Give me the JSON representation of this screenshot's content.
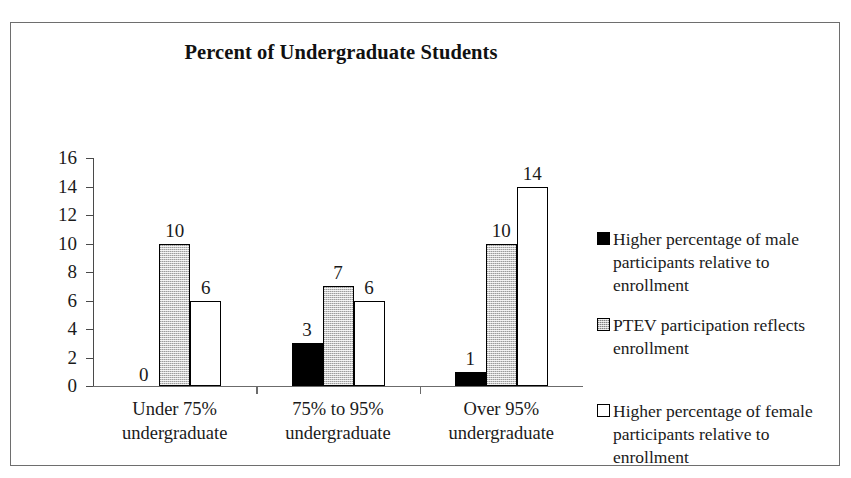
{
  "chart_data": {
    "type": "bar",
    "title": "Percent of Undergraduate Students",
    "xlabel": "",
    "ylabel": "",
    "ylim": [
      0,
      16
    ],
    "ytick_step": 2,
    "yticks": [
      "16",
      "14",
      "12",
      "10",
      "8",
      "6",
      "4",
      "2",
      "0"
    ],
    "grid": false,
    "legend_position": "right",
    "categories": [
      "Under 75%\nundergraduate",
      "75% to 95%\nundergraduate",
      "Over 95%\nundergraduate"
    ],
    "category_lines": [
      [
        "Under 75%",
        "undergraduate"
      ],
      [
        "75% to 95%",
        "undergraduate"
      ],
      [
        "Over 95%",
        "undergraduate"
      ]
    ],
    "series": [
      {
        "name": "Higher percentage of male participants relative to enrollment",
        "style": "black",
        "color": "#000000",
        "values": [
          0,
          3,
          1
        ]
      },
      {
        "name": "PTEV participation reflects enrollment",
        "style": "gray",
        "color": "#c9c9c9",
        "values": [
          10,
          7,
          10
        ]
      },
      {
        "name": "Higher percentage of female participants relative to enrollment",
        "style": "white",
        "color": "#ffffff",
        "values": [
          6,
          6,
          14
        ]
      }
    ],
    "data_labels": [
      [
        "0",
        "10",
        "6"
      ],
      [
        "3",
        "7",
        "6"
      ],
      [
        "1",
        "10",
        "14"
      ]
    ]
  },
  "legend": {
    "items": [
      {
        "swatch": "black",
        "lines": [
          "Higher percentage of male",
          "participants relative to",
          "enrollment"
        ],
        "text": "Higher percentage of male participants relative to enrollment"
      },
      {
        "swatch": "gray",
        "lines": [
          "PTEV participation reflects",
          "enrollment"
        ],
        "text": "PTEV participation reflects enrollment"
      },
      {
        "swatch": "white",
        "lines": [
          "Higher percentage of female",
          "participants relative to",
          "enrollment"
        ],
        "text": "Higher percentage of female participants relative to enrollment"
      }
    ]
  }
}
